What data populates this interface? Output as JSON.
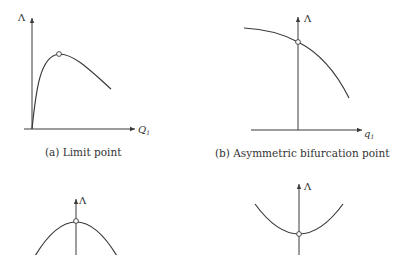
{
  "figure": {
    "panels": [
      {
        "id": "a",
        "caption": "(a) Limit point",
        "y_label": "Λ",
        "x_label": "Q",
        "x_label_sub": "1",
        "point_type": "limit"
      },
      {
        "id": "b",
        "caption": "(b) Asymmetric bifurcation point",
        "y_label": "Λ",
        "x_label": "q",
        "x_label_sub": "1",
        "point_type": "asymmetric-bifurcation"
      },
      {
        "id": "c",
        "caption": "",
        "y_label": "Λ",
        "point_type": "unstable-symmetric-bifurcation"
      },
      {
        "id": "d",
        "caption": "",
        "y_label": "Λ",
        "point_type": "stable-symmetric-bifurcation"
      }
    ]
  }
}
